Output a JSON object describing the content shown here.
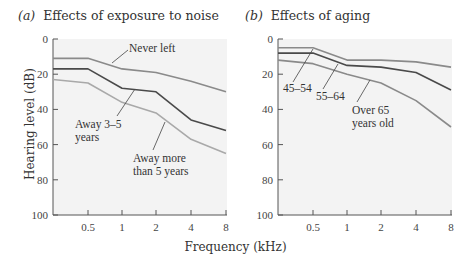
{
  "panels": {
    "a": {
      "letter": "(a)",
      "title": "Effects of exposure to noise"
    },
    "b": {
      "letter": "(b)",
      "title": "Effects of aging"
    }
  },
  "axes": {
    "ylabel": "Hearing level (dB)",
    "xlabel": "Frequency (kHz)",
    "yticks": [
      "0",
      "20",
      "40",
      "60",
      "80",
      "100"
    ],
    "xticks": [
      "0.5",
      "1",
      "2",
      "4",
      "8"
    ]
  },
  "colors": {
    "plot_bg": "#f3f3f3",
    "axis": "#555555",
    "light": "#a9a9a9",
    "medium": "#8a8a8a",
    "dark": "#4a4a4a"
  },
  "chart_data": [
    {
      "type": "line",
      "title": "(a) Effects of exposure to noise",
      "xlabel": "Frequency (kHz)",
      "ylabel": "Hearing level (dB)",
      "x": [
        0.25,
        0.5,
        1,
        2,
        4,
        8
      ],
      "xticks": [
        0.5,
        1,
        2,
        4,
        8
      ],
      "xscale": "log2",
      "ylim": [
        0,
        100
      ],
      "y_inverted": true,
      "grid": false,
      "series": [
        {
          "name": "Never left",
          "color": "#8a8a8a",
          "values": [
            11,
            11,
            17,
            19,
            24,
            30
          ]
        },
        {
          "name": "Away 3–5 years",
          "color": "#4a4a4a",
          "values": [
            17,
            17,
            28,
            30,
            46,
            52
          ]
        },
        {
          "name": "Away more than 5 years",
          "color": "#a9a9a9",
          "values": [
            23,
            25,
            36,
            42,
            57,
            65
          ]
        }
      ],
      "annotations": [
        "Never left",
        "Away 3–5 years",
        "Away more than 5 years"
      ]
    },
    {
      "type": "line",
      "title": "(b) Effects of aging",
      "xlabel": "Frequency (kHz)",
      "ylabel": "Hearing level (dB)",
      "x": [
        0.25,
        0.5,
        1,
        2,
        4,
        8
      ],
      "xticks": [
        0.5,
        1,
        2,
        4,
        8
      ],
      "xscale": "log2",
      "ylim": [
        0,
        100
      ],
      "y_inverted": true,
      "grid": false,
      "series": [
        {
          "name": "45–54",
          "color": "#8a8a8a",
          "values": [
            5,
            5,
            12,
            12,
            13,
            16
          ]
        },
        {
          "name": "55–64",
          "color": "#4a4a4a",
          "values": [
            8,
            8,
            15,
            16,
            19,
            29
          ]
        },
        {
          "name": "Over 65 years old",
          "color": "#8a8a8a",
          "values": [
            12,
            14,
            20,
            25,
            35,
            50
          ]
        }
      ],
      "annotations": [
        "45–54",
        "55–64",
        "Over 65 years old"
      ]
    }
  ],
  "labels": {
    "a": {
      "never_left": "Never left",
      "away35_l1": "Away 3–5",
      "away35_l2": "years",
      "awaymore_l1": "Away more",
      "awaymore_l2": "than 5 years"
    },
    "b": {
      "g4554": "45–54",
      "g5564": "55–64",
      "over65_l1": "Over 65",
      "over65_l2": "years old"
    }
  }
}
